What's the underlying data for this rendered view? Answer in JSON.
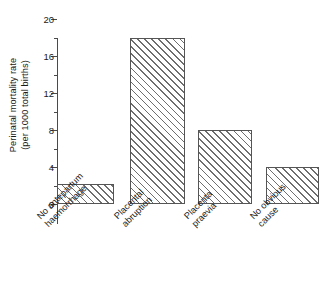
{
  "chart_data": {
    "type": "bar",
    "title": "",
    "subtitle": "",
    "xlabel": "",
    "ylabel": "Perinatal mortality rate (per 1000 total births)",
    "ylabel_line1": "Perinatal mortality rate",
    "ylabel_line2": "(per 1000 total births)",
    "ylim": [
      0,
      20
    ],
    "ytick_values": [
      0,
      4,
      8,
      12,
      16,
      20
    ],
    "ytick_labels": [
      "0",
      "4",
      "8",
      "12",
      "16",
      "20"
    ],
    "yminor_tick_values": [
      2,
      6,
      10,
      14,
      18
    ],
    "grid": false,
    "legend": "none",
    "categories": [
      "No antepartum haemorrhage",
      "Placental abruption",
      "Placenta praevia",
      "No obvious cause"
    ],
    "category_lines": [
      [
        "No antepartum",
        "haemorrhage"
      ],
      [
        "Placental",
        "abruption"
      ],
      [
        "Placenta",
        "praevia"
      ],
      [
        "No obvious",
        "cause"
      ]
    ],
    "values": [
      2.2,
      18,
      8,
      4
    ],
    "value_labels": [
      "2.2",
      "18",
      "8",
      "4"
    ],
    "bar_fill": "hatched-diagonal",
    "bar_edge_color": "#555555",
    "bar_hatch_color": "#6e6e6e",
    "axis_color": "#4a4a4a",
    "background": "#ffffff",
    "bars": [
      {
        "category": "No antepartum haemorrhage",
        "value": 2.2,
        "left_px": 0,
        "width_px": 57
      },
      {
        "category": "Placental abruption",
        "value": 18,
        "left_px": 73,
        "width_px": 55
      },
      {
        "category": "Placenta praevia",
        "value": 8,
        "left_px": 141,
        "width_px": 54
      },
      {
        "category": "No obvious cause",
        "value": 4,
        "left_px": 209,
        "width_px": 53
      }
    ],
    "label_positions": [
      {
        "left_px": 35,
        "top_px": 214
      },
      {
        "left_px": 112,
        "top_px": 214
      },
      {
        "left_px": 182,
        "top_px": 214
      },
      {
        "left_px": 248,
        "top_px": 214
      }
    ]
  }
}
